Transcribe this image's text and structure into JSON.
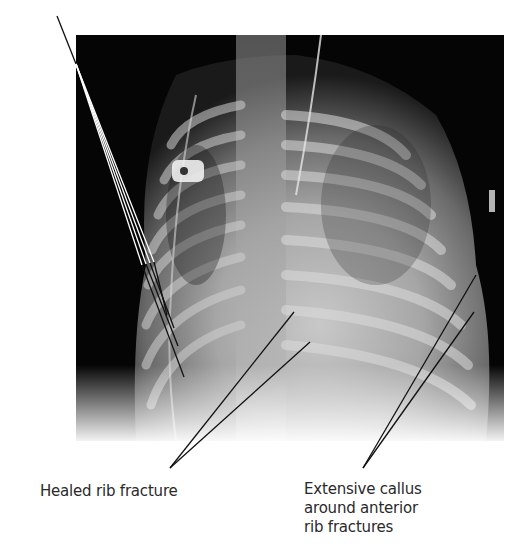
{
  "figure": {
    "image_description": "Infant chest radiograph",
    "labels": [
      {
        "id": "healed",
        "lines": [
          "Healed rib fracture"
        ]
      },
      {
        "id": "callus",
        "lines": [
          "Extensive callus",
          "around anterior",
          "rib fractures"
        ]
      }
    ]
  },
  "colors": {
    "background": "#ffffff",
    "xray_dark": "#050505",
    "leader_line": "#111111",
    "label_text": "#2a2a2a"
  }
}
